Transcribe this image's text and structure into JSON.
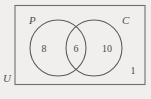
{
  "diagram": {
    "type": "venn",
    "universe": {
      "label": "U",
      "name": "universal-set",
      "outside_count": "1"
    },
    "sets": [
      {
        "id": "P",
        "label": "P",
        "only_count": "8"
      },
      {
        "id": "C",
        "label": "C",
        "only_count": "10"
      }
    ],
    "intersection": {
      "label": "P and C",
      "count": "6"
    },
    "colors": {
      "background": "#f0efed",
      "rect_stroke": "#6e6e6e",
      "circle_stroke": "#5a5a5a",
      "text": "#4a4a4a"
    }
  }
}
